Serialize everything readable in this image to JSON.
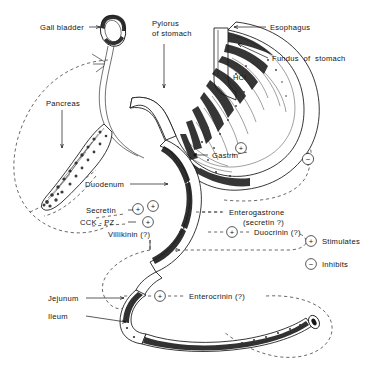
{
  "figure": {
    "background_color": "#ffffff",
    "ink_color": "#141414"
  },
  "anatomy_labels": {
    "gall_bladder": "Gall bladder",
    "pylorus_line1": "Pylorus",
    "pylorus_line2": "of stomach",
    "esophagus": "Esophagus",
    "fundus": "Fundus  of  stomach",
    "hcl": "HCl",
    "pancreas": "Pancreas",
    "duodenum": "Duodenum",
    "jejunum": "Jejunum",
    "ileum": "Ileum"
  },
  "hormone_labels": {
    "gastrin": "Gastrin",
    "secretin": "Secretin",
    "cck_pz": "CCK - PZ",
    "villikinin": "Villikinin (?)",
    "enterogastrone_line1": "Enterogastrone",
    "enterogastrone_line2": "(secretin ?)",
    "duocrinin": "Duocrinin (?)",
    "enterocrinin": "Enterocrinin (?)"
  },
  "signs": {
    "plus": "+",
    "minus": "−"
  },
  "legend": {
    "stimulates_symbol": "+",
    "stimulates_label": "Stimulates",
    "inhibits_symbol": "−",
    "inhibits_label": "Inhibits"
  },
  "sign_markers": [
    {
      "name": "gastrin-plus",
      "sign": "+"
    },
    {
      "name": "enterogastrone-minus",
      "sign": "−"
    },
    {
      "name": "secretin-plus-a",
      "sign": "+"
    },
    {
      "name": "secretin-plus-b",
      "sign": "+"
    },
    {
      "name": "cck-pz-plus",
      "sign": "+"
    },
    {
      "name": "duocrinin-plus",
      "sign": "+"
    },
    {
      "name": "enterocrinin-plus",
      "sign": "+"
    }
  ]
}
